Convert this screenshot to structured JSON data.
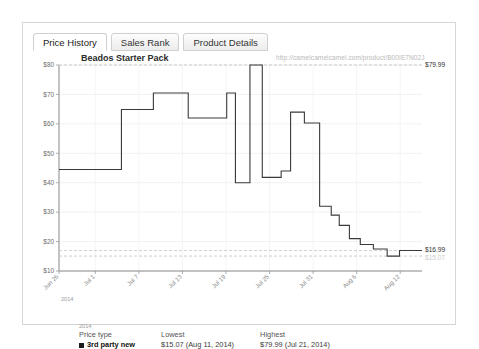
{
  "panel": {
    "tabs": [
      {
        "label": "Price History",
        "active": true
      },
      {
        "label": "Sales Rank",
        "active": false
      },
      {
        "label": "Product Details",
        "active": false
      }
    ]
  },
  "chart_header": {
    "title": "Beados Starter Pack",
    "watermark": "http://camelcamelcamel.com/product/B00IE7N02J"
  },
  "edge_labels": {
    "top_right": "$79.99",
    "bottom_right_primary": "$16.99",
    "bottom_right_secondary": "$15.07"
  },
  "legend": {
    "headers": [
      "Price type",
      "Lowest",
      "Highest"
    ],
    "rows": [
      {
        "series": "3rd party new",
        "color": "#1c1c1c",
        "lowest": "$15.07 (Aug 11, 2014)",
        "highest": "$79.99 (Jul 21, 2014)"
      }
    ]
  },
  "chart_data": {
    "type": "line",
    "title": "Beados Starter Pack",
    "xlabel": "2014",
    "ylabel": "",
    "grid": true,
    "legend_position": "below",
    "step_style": "step-post",
    "ylim": [
      10,
      80
    ],
    "yticks": [
      10,
      20,
      30,
      40,
      50,
      60,
      70,
      80
    ],
    "ytick_labels": [
      "$10",
      "$20",
      "$30",
      "$40",
      "$50",
      "$60",
      "$70",
      "$80"
    ],
    "xtick_labels": [
      "Jun 26",
      "Jul 1",
      "Jul 7",
      "Jul 13",
      "Jul 19",
      "Jul 25",
      "Jul 31",
      "Aug 6",
      "Aug 12"
    ],
    "xtick_positions": [
      0,
      5,
      11,
      17,
      23,
      29,
      35,
      41,
      47
    ],
    "xlim": [
      0,
      50
    ],
    "year_label": "2014",
    "reference_lines": [
      {
        "value": 79.99,
        "label": "$79.99",
        "style": "dashed"
      },
      {
        "value": 16.99,
        "label": "$16.99",
        "style": "dashed"
      },
      {
        "value": 15.07,
        "label": "$15.07",
        "style": "dashed"
      }
    ],
    "series": [
      {
        "name": "3rd party new",
        "color": "#3a3a3a",
        "lowest": 15.07,
        "lowest_date": "Aug 11, 2014",
        "highest": 79.99,
        "highest_date": "Jul 21, 2014",
        "points": [
          {
            "x": 0.0,
            "y": 44.5
          },
          {
            "x": 8.6,
            "y": 44.5
          },
          {
            "x": 8.6,
            "y": 64.9
          },
          {
            "x": 13.0,
            "y": 64.9
          },
          {
            "x": 13.0,
            "y": 70.5
          },
          {
            "x": 17.8,
            "y": 70.5
          },
          {
            "x": 17.8,
            "y": 62.0
          },
          {
            "x": 23.1,
            "y": 62.0
          },
          {
            "x": 23.1,
            "y": 70.5
          },
          {
            "x": 24.3,
            "y": 70.5
          },
          {
            "x": 24.3,
            "y": 40.0
          },
          {
            "x": 26.3,
            "y": 40.0
          },
          {
            "x": 26.3,
            "y": 79.99
          },
          {
            "x": 28.0,
            "y": 79.99
          },
          {
            "x": 28.0,
            "y": 41.8
          },
          {
            "x": 30.6,
            "y": 41.8
          },
          {
            "x": 30.6,
            "y": 44.0
          },
          {
            "x": 31.9,
            "y": 44.0
          },
          {
            "x": 31.9,
            "y": 64.0
          },
          {
            "x": 33.8,
            "y": 64.0
          },
          {
            "x": 33.8,
            "y": 60.3
          },
          {
            "x": 35.9,
            "y": 60.3
          },
          {
            "x": 35.9,
            "y": 32.0
          },
          {
            "x": 37.5,
            "y": 32.0
          },
          {
            "x": 37.5,
            "y": 29.0
          },
          {
            "x": 38.6,
            "y": 29.0
          },
          {
            "x": 38.6,
            "y": 25.5
          },
          {
            "x": 40.0,
            "y": 25.5
          },
          {
            "x": 40.0,
            "y": 21.0
          },
          {
            "x": 41.5,
            "y": 21.0
          },
          {
            "x": 41.5,
            "y": 19.0
          },
          {
            "x": 43.3,
            "y": 19.0
          },
          {
            "x": 43.3,
            "y": 17.5
          },
          {
            "x": 45.2,
            "y": 17.5
          },
          {
            "x": 45.2,
            "y": 15.07
          },
          {
            "x": 46.9,
            "y": 15.07
          },
          {
            "x": 46.9,
            "y": 16.99
          },
          {
            "x": 50.0,
            "y": 16.99
          }
        ]
      }
    ]
  }
}
